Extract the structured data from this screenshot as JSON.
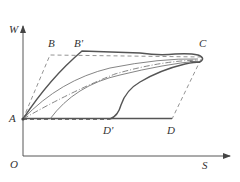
{
  "diagram": {
    "axes": {
      "y_label": "W",
      "x_label": "S",
      "origin_label": "O"
    },
    "points": {
      "A": "A",
      "B": "B",
      "B_prime": "B'",
      "C": "C",
      "D": "D",
      "D_prime": "D'"
    },
    "colors": {
      "axis": "#444444",
      "thick_curve": "#555555",
      "thin_curve": "#777777",
      "dashed": "#888888",
      "text": "#333333"
    }
  }
}
